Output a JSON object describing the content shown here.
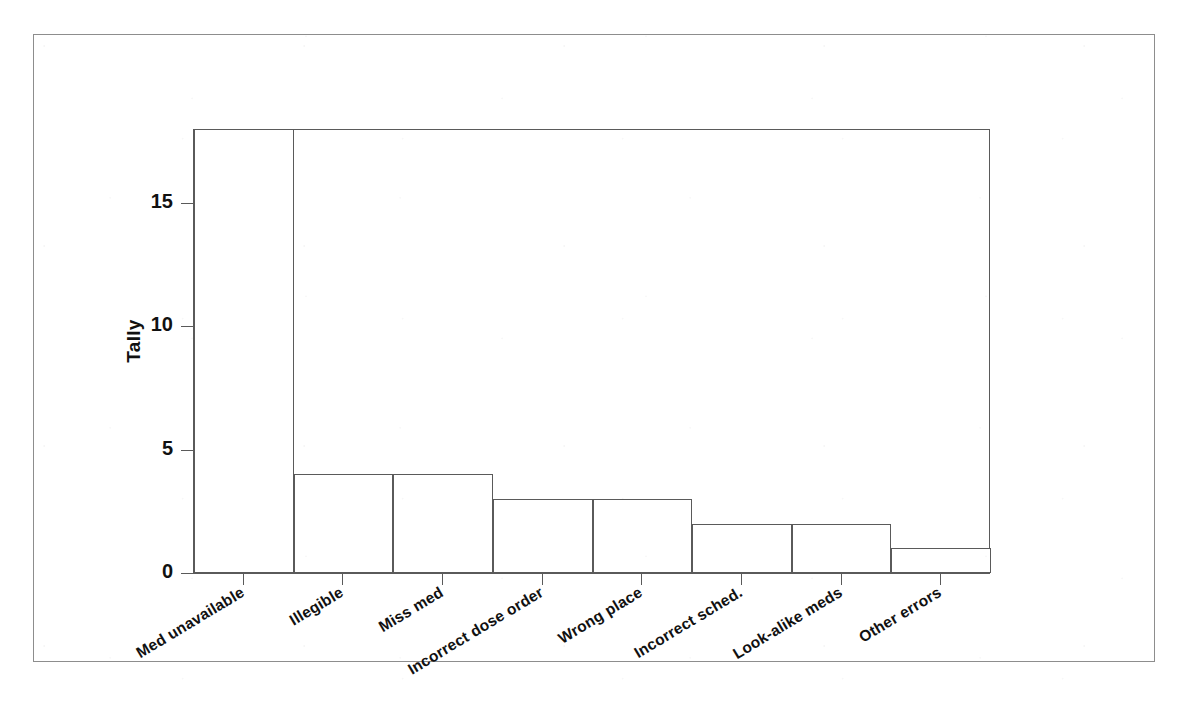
{
  "chart_data": {
    "type": "bar",
    "title": "",
    "subtitle": "",
    "xlabel": "",
    "ylabel": "Tally",
    "categories": [
      "Med unavailable",
      "Illegible",
      "Miss med",
      "Incorrect dose order",
      "Wrong place",
      "Incorrect sched.",
      "Look-alike meds",
      "Other errors"
    ],
    "values": [
      18,
      4,
      4,
      3,
      3,
      2,
      2,
      1
    ],
    "ylim": [
      0,
      18
    ],
    "ytick_labels": [
      "0",
      "5",
      "10",
      "15"
    ],
    "ytick_values": [
      0,
      5,
      10,
      15
    ],
    "grid": false,
    "legend": false,
    "bar_style": "outline",
    "bar_fill": "#ffffff",
    "bar_edge_color": "#5a5a5a",
    "axis_color": "#5a5a5a",
    "text_color": "#111111",
    "background": "#ffffff",
    "xlabel_rotation_deg": -31
  },
  "page": {
    "border_color": "#8d8d8d"
  }
}
